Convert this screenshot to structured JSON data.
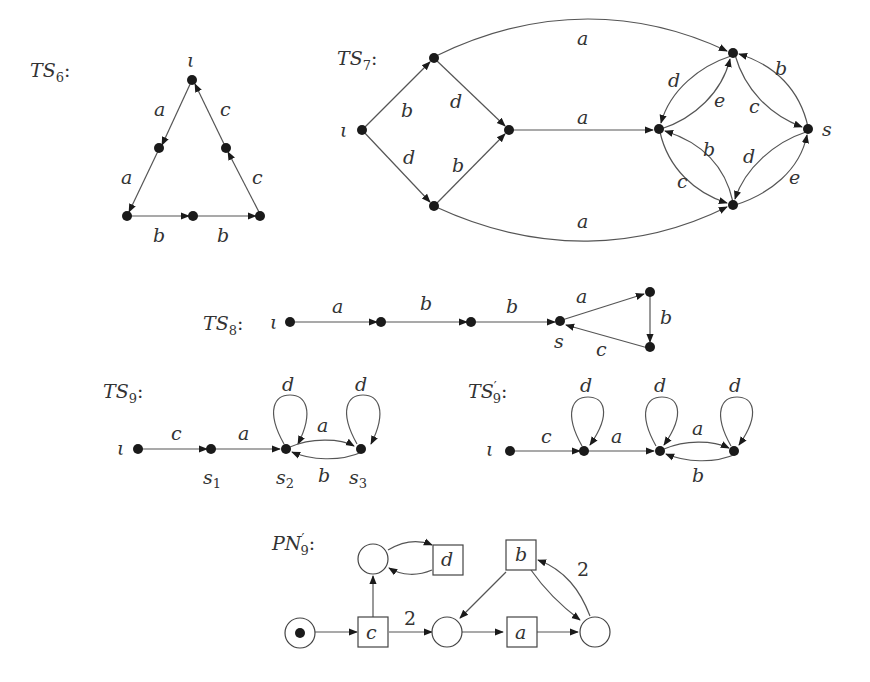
{
  "diagrams": {
    "ts6": {
      "title": "TS6:",
      "initial_label": "ι",
      "edge_labels": {
        "a1": "a",
        "a2": "a",
        "b1": "b",
        "b2": "b",
        "c1": "c",
        "c2": "c"
      }
    },
    "ts7": {
      "title": "TS7:",
      "initial_label": "ι",
      "state_label_s": "s",
      "edge_labels": {
        "top_a": "a",
        "mid_a": "a",
        "bot_a": "a",
        "i_b": "b",
        "i_d": "d",
        "up_d": "d",
        "low_b": "b",
        "top_left_d": "d",
        "left_top_e": "e",
        "top_s_c": "c",
        "s_top_b": "b",
        "left_bot_c": "c",
        "bot_left_b": "b",
        "s_bot_d": "d",
        "bot_s_e": "e"
      }
    },
    "ts8": {
      "title": "TS8:",
      "initial_label": "ι",
      "state_label_s": "s",
      "edge_labels": {
        "a": "a",
        "b1": "b",
        "b2": "b",
        "tri_a": "a",
        "tri_b": "b",
        "tri_c": "c"
      }
    },
    "ts9": {
      "title": "TS9:",
      "initial_label": "ι",
      "state_labels": {
        "s1": "s1",
        "s2": "s2",
        "s3": "s3"
      },
      "edge_labels": {
        "c": "c",
        "a": "a",
        "loop_s2": "d",
        "loop_s3": "d",
        "s2_s3": "a",
        "s3_s2": "b"
      }
    },
    "ts9p": {
      "title": "TS'9:",
      "initial_label": "ι",
      "edge_labels": {
        "c": "c",
        "a": "a",
        "loop1": "d",
        "loop2": "d",
        "loop3": "d",
        "fwd_a": "a",
        "back_b": "b"
      }
    },
    "pn9p": {
      "title": "PN'9:",
      "transitions": {
        "c": "c",
        "d": "d",
        "a": "a",
        "b": "b"
      },
      "arc_weights": {
        "c_to_p2": "2",
        "p3_to_b": "2"
      },
      "initial_tokens": 1
    }
  }
}
